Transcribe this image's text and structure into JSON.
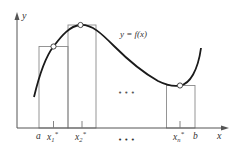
{
  "diagram": {
    "axes": {
      "x_label": "x",
      "y_label": "y"
    },
    "curve_label": "y = f(x)",
    "interval": {
      "start_label": "a",
      "end_label": "b"
    },
    "sample_points": [
      {
        "label": "x",
        "sub": "1",
        "sup": "*"
      },
      {
        "label": "x",
        "sub": "2",
        "sup": "*"
      },
      {
        "label": "x",
        "sub": "n",
        "sup": "*"
      }
    ],
    "ellipsis": "• • •",
    "colors": {
      "curve": "#1a1a1a",
      "axes": "#555555",
      "rectangles": "#8a8a8a",
      "text": "#333333"
    }
  }
}
